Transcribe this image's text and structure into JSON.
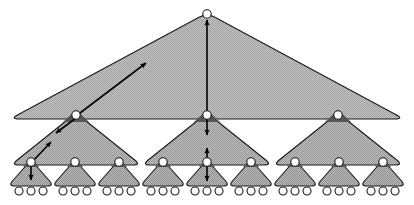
{
  "diagram": {
    "type": "tree-hierarchy",
    "width": 414,
    "height": 205,
    "background": "#ffffff",
    "levels": 3,
    "branching_factor": 3,
    "counts": {
      "root_nodes": 1,
      "level1_nodes": 3,
      "level2_nodes": 9,
      "leaf_nodes": 27,
      "level0_triangles": 1,
      "level1_triangles": 3,
      "level2_triangles": 9
    },
    "colors": {
      "fill_level0": "#b4b4b4",
      "fill_level1": "#a8a8a8",
      "fill_level2": "#a0a0a0",
      "fill_leafgroup": "#9c9c9c",
      "node_shadow": "#4a4a4a",
      "stroke": "#1a1a1a",
      "node_fill": "#ffffff",
      "arrow": "#000000",
      "background": "#ffffff"
    },
    "stroke_width": 1.1,
    "node_radius": 4.2,
    "leaf_radius": 4.0
  },
  "triangles": {
    "level0": [
      {
        "id": "t0",
        "apex_x": 207,
        "apex_y": 13,
        "base_y": 119,
        "half_width": 197,
        "corner_radius": 9
      }
    ],
    "level1": [
      {
        "id": "t1-a",
        "apex_x": 76,
        "apex_y": 113,
        "base_y": 165,
        "half_width": 65,
        "corner_radius": 8
      },
      {
        "id": "t1-b",
        "apex_x": 207,
        "apex_y": 113,
        "base_y": 165,
        "half_width": 65,
        "corner_radius": 8
      },
      {
        "id": "t1-c",
        "apex_x": 338,
        "apex_y": 113,
        "base_y": 165,
        "half_width": 65,
        "corner_radius": 8
      }
    ],
    "level2": [
      {
        "id": "t2-1",
        "apex_x": 31,
        "apex_y": 160,
        "base_y": 186,
        "half_width": 23,
        "corner_radius": 7
      },
      {
        "id": "t2-2",
        "apex_x": 75,
        "apex_y": 160,
        "base_y": 186,
        "half_width": 23,
        "corner_radius": 7
      },
      {
        "id": "t2-3",
        "apex_x": 119,
        "apex_y": 160,
        "base_y": 186,
        "half_width": 23,
        "corner_radius": 7
      },
      {
        "id": "t2-4",
        "apex_x": 163,
        "apex_y": 160,
        "base_y": 186,
        "half_width": 23,
        "corner_radius": 7
      },
      {
        "id": "t2-5",
        "apex_x": 207,
        "apex_y": 160,
        "base_y": 186,
        "half_width": 23,
        "corner_radius": 7
      },
      {
        "id": "t2-6",
        "apex_x": 251,
        "apex_y": 160,
        "base_y": 186,
        "half_width": 23,
        "corner_radius": 7
      },
      {
        "id": "t2-7",
        "apex_x": 295,
        "apex_y": 160,
        "base_y": 186,
        "half_width": 23,
        "corner_radius": 7
      },
      {
        "id": "t2-8",
        "apex_x": 339,
        "apex_y": 160,
        "base_y": 186,
        "half_width": 23,
        "corner_radius": 7
      },
      {
        "id": "t2-9",
        "apex_x": 383,
        "apex_y": 160,
        "base_y": 186,
        "half_width": 23,
        "corner_radius": 7
      }
    ]
  },
  "nodes": {
    "root": {
      "id": "n-root",
      "x": 207,
      "y": 14
    },
    "level1": [
      {
        "id": "n1-a",
        "x": 76,
        "y": 115
      },
      {
        "id": "n1-b",
        "x": 207,
        "y": 115
      },
      {
        "id": "n1-c",
        "x": 338,
        "y": 115
      }
    ],
    "level2": [
      {
        "id": "n2-1",
        "x": 31,
        "y": 162
      },
      {
        "id": "n2-2",
        "x": 75,
        "y": 162
      },
      {
        "id": "n2-3",
        "x": 119,
        "y": 162
      },
      {
        "id": "n2-4",
        "x": 163,
        "y": 162
      },
      {
        "id": "n2-5",
        "x": 207,
        "y": 162
      },
      {
        "id": "n2-6",
        "x": 251,
        "y": 162
      },
      {
        "id": "n2-7",
        "x": 295,
        "y": 162
      },
      {
        "id": "n2-8",
        "x": 339,
        "y": 162
      },
      {
        "id": "n2-9",
        "x": 383,
        "y": 162
      }
    ],
    "leaves": [
      {
        "id": "lf-1",
        "x": 19,
        "y": 191
      },
      {
        "id": "lf-2",
        "x": 31,
        "y": 191
      },
      {
        "id": "lf-3",
        "x": 43,
        "y": 191
      },
      {
        "id": "lf-4",
        "x": 63,
        "y": 191
      },
      {
        "id": "lf-5",
        "x": 75,
        "y": 191
      },
      {
        "id": "lf-6",
        "x": 87,
        "y": 191
      },
      {
        "id": "lf-7",
        "x": 107,
        "y": 191
      },
      {
        "id": "lf-8",
        "x": 119,
        "y": 191
      },
      {
        "id": "lf-9",
        "x": 131,
        "y": 191
      },
      {
        "id": "lf-10",
        "x": 151,
        "y": 191
      },
      {
        "id": "lf-11",
        "x": 163,
        "y": 191
      },
      {
        "id": "lf-12",
        "x": 175,
        "y": 191
      },
      {
        "id": "lf-13",
        "x": 195,
        "y": 191
      },
      {
        "id": "lf-14",
        "x": 207,
        "y": 191
      },
      {
        "id": "lf-15",
        "x": 219,
        "y": 191
      },
      {
        "id": "lf-16",
        "x": 239,
        "y": 191
      },
      {
        "id": "lf-17",
        "x": 251,
        "y": 191
      },
      {
        "id": "lf-18",
        "x": 263,
        "y": 191
      },
      {
        "id": "lf-19",
        "x": 283,
        "y": 191
      },
      {
        "id": "lf-20",
        "x": 295,
        "y": 191
      },
      {
        "id": "lf-21",
        "x": 307,
        "y": 191
      },
      {
        "id": "lf-22",
        "x": 327,
        "y": 191
      },
      {
        "id": "lf-23",
        "x": 339,
        "y": 191
      },
      {
        "id": "lf-24",
        "x": 351,
        "y": 191
      },
      {
        "id": "lf-25",
        "x": 371,
        "y": 191
      },
      {
        "id": "lf-26",
        "x": 383,
        "y": 191
      },
      {
        "id": "lf-27",
        "x": 395,
        "y": 191
      }
    ]
  },
  "arrows": [
    {
      "id": "arrow-diag-upper",
      "x1": 76,
      "y1": 116,
      "x2": 146,
      "y2": 63,
      "head_start": false,
      "head_end": true
    },
    {
      "id": "arrow-diag-down",
      "x1": 76,
      "y1": 118,
      "x2": 56,
      "y2": 133,
      "head_start": false,
      "head_end": true
    },
    {
      "id": "arrow-diag-lower",
      "x1": 31,
      "y1": 163,
      "x2": 51,
      "y2": 142,
      "head_start": false,
      "head_end": true
    },
    {
      "id": "arrow-leaf-down",
      "x1": 31,
      "y1": 164,
      "x2": 31,
      "y2": 180,
      "head_start": false,
      "head_end": true
    },
    {
      "id": "arrow-vert-top",
      "x1": 207,
      "y1": 20,
      "x2": 207,
      "y2": 113,
      "head_start": true,
      "head_end": false
    },
    {
      "id": "arrow-vert-mid",
      "x1": 207,
      "y1": 117,
      "x2": 207,
      "y2": 135,
      "head_start": false,
      "head_end": true
    },
    {
      "id": "arrow-vert-lower",
      "x1": 207,
      "y1": 148,
      "x2": 207,
      "y2": 160,
      "head_start": true,
      "head_end": false
    },
    {
      "id": "arrow-vert-leaf",
      "x1": 207,
      "y1": 164,
      "x2": 207,
      "y2": 181,
      "head_start": false,
      "head_end": true
    }
  ],
  "labels": {
    "caption": ""
  }
}
